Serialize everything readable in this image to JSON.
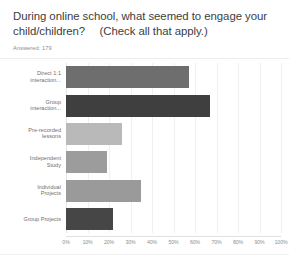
{
  "header": {
    "question": "During online school, what seemed to engage your child/children?  (Check all that apply.)",
    "answered_label": "Answered: 179"
  },
  "chart_data": {
    "type": "bar",
    "orientation": "horizontal",
    "subtitle": "Answered: 179",
    "xlabel": "",
    "ylabel": "",
    "xlim": [
      0,
      100
    ],
    "grid": true,
    "legend": "none",
    "categories": [
      "Direct 1:1\ninteraction...",
      "Group\ninteraction...",
      "Pre-recorded\nlessons",
      "Independent\nStudy",
      "Individual\nProjects",
      "Group Projects"
    ],
    "values": [
      57,
      67,
      26,
      19,
      35,
      22
    ],
    "colors": [
      "#6e6e6e",
      "#3f3f3f",
      "#b9b9b9",
      "#9c9c9c",
      "#9a9a9a",
      "#464646"
    ],
    "tick_labels": [
      "0%",
      "10%",
      "20%",
      "30%",
      "40%",
      "50%",
      "60%",
      "70%",
      "80%",
      "90%",
      "100%"
    ],
    "tick_values": [
      0,
      10,
      20,
      30,
      40,
      50,
      60,
      70,
      80,
      90,
      100
    ]
  }
}
